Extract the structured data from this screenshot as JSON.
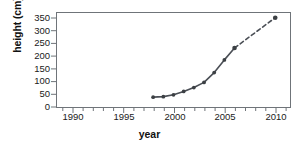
{
  "chart_data": {
    "type": "line",
    "title": "",
    "xlabel": "year",
    "ylabel": "height (cm)",
    "xlim": [
      1988.5,
      2011.5
    ],
    "ylim": [
      0,
      365
    ],
    "xticks": [
      1990,
      1995,
      2000,
      2005,
      2010
    ],
    "xtick_labels": [
      "1990",
      "1995",
      "2000",
      "2005",
      "2010"
    ],
    "x_minor_tick_step": 1,
    "yticks": [
      0,
      50,
      100,
      150,
      200,
      250,
      300,
      350
    ],
    "ytick_labels": [
      "0",
      "50",
      "100",
      "150",
      "200",
      "250",
      "300",
      "350"
    ],
    "grid": false,
    "legend": null,
    "line_color": "#4b4f56",
    "marker_color": "#3c4044",
    "series": [
      {
        "name": "measured",
        "style": "solid",
        "x": [
          1998,
          1999,
          2000,
          2001,
          2002,
          2003,
          2004,
          2005,
          2006
        ],
        "y": [
          38,
          40,
          47,
          60,
          75,
          95,
          133,
          182,
          228
        ]
      },
      {
        "name": "projected",
        "style": "dashed",
        "x": [
          2006,
          2010
        ],
        "y": [
          228,
          345
        ]
      }
    ]
  }
}
